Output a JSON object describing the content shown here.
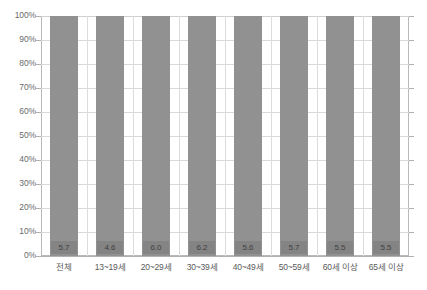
{
  "chart_data": {
    "type": "bar",
    "title": "",
    "subtitle": "",
    "xlabel": "",
    "ylabel": "",
    "categories": [
      "전체",
      "13~19세",
      "20~29세",
      "30~39세",
      "40~49세",
      "50~59세",
      "60세 이상",
      "65세 이상"
    ],
    "values": [
      100,
      100,
      100,
      100,
      100,
      100,
      100,
      100
    ],
    "data_labels": [
      "5.7",
      "4.6",
      "6.0",
      "6.2",
      "5.6",
      "5.7",
      "5.5",
      "5.5"
    ],
    "ylim": [
      0,
      100
    ],
    "ytick_labels": [
      "100%",
      "90%",
      "80%",
      "70%",
      "60%",
      "50%",
      "40%",
      "30%",
      "20%",
      "10%",
      "0%"
    ],
    "ytick_values": [
      100,
      90,
      80,
      70,
      60,
      50,
      40,
      30,
      20,
      10,
      0
    ],
    "grid": true,
    "legend": false,
    "legend_position": "none",
    "series": [
      {
        "name": "",
        "values": [
          100,
          100,
          100,
          100,
          100,
          100,
          100,
          100
        ],
        "labels": [
          "5.7",
          "4.6",
          "6.0",
          "6.2",
          "5.6",
          "5.7",
          "5.5",
          "5.5"
        ]
      }
    ],
    "colors": {
      "bar": "#919191",
      "label_box": "#848484",
      "label_text": "#3f3f3f",
      "gridline": "#d9d9d9",
      "axis": "#b0b0b0",
      "tick_text": "#6b6b6b",
      "category_text": "#5a5a5a",
      "background": "#ffffff"
    }
  }
}
